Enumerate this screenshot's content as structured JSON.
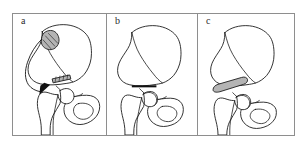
{
  "figure": {
    "type": "anatomical-line-diagram",
    "view": "anteroposterior-radiographic-outline",
    "background_color": "#ffffff",
    "frame_color": "#8e8e8e",
    "line_color": "#1a1a1a",
    "graft_fill_color": "#b4b4b4",
    "panel_count": 3
  },
  "panels": [
    {
      "id": "panel-a",
      "label": "a",
      "caption_text": "",
      "stage": "graft-harvest-and-transfer",
      "elements": {
        "pelvis": "iliac-wing-outline",
        "femur": "proximal-femur-outline",
        "graft_blob": "harvested-iliac-crest-bone-graft",
        "arrow": "transfer-direction-arrow",
        "osteotomy_marker": "hatched-supra-acetabular-wedge"
      }
    },
    {
      "id": "panel-b",
      "label": "b",
      "caption_text": "",
      "stage": "supra-acetabular-osteotomy",
      "elements": {
        "pelvis": "iliac-wing-outline",
        "femur": "proximal-femur-outline",
        "osteotomy_line": "horizontal-supra-acetabular-osteotomy-cut"
      }
    },
    {
      "id": "panel-c",
      "label": "c",
      "caption_text": "",
      "stage": "graft-wedge-in-place",
      "elements": {
        "pelvis": "iliac-wing-outline",
        "femur": "proximal-femur-outline",
        "graft_wedge": "inserted-bone-graft-wedge"
      }
    }
  ]
}
